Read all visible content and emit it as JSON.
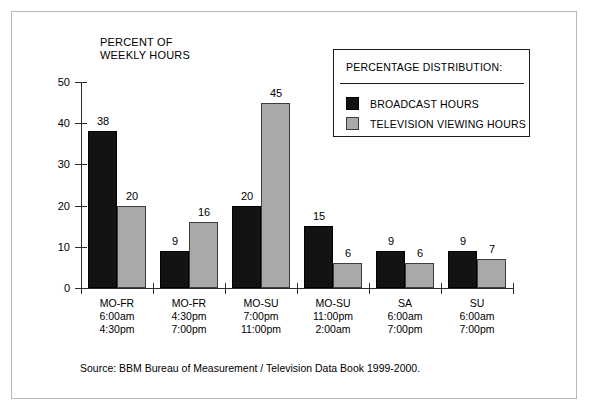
{
  "chart_data": {
    "type": "bar",
    "title": "PERCENT OF\nWEEKLY HOURS",
    "xlabel": "",
    "ylabel": "PERCENT OF WEEKLY HOURS",
    "ylim": [
      0,
      50
    ],
    "yticks": [
      0,
      10,
      20,
      30,
      40,
      50
    ],
    "grid": false,
    "legend_position": "top-right",
    "legend_title": "PERCENTAGE DISTRIBUTION:",
    "categories": [
      "MO-FR\n6:00am\n4:30pm",
      "MO-FR\n4:30pm\n7:00pm",
      "MO-SU\n7:00pm\n11:00pm",
      "MO-SU\n11:00pm\n2:00am",
      "SA\n6:00am\n7:00pm",
      "SU\n6:00am\n7:00pm"
    ],
    "series": [
      {
        "name": "BROADCAST HOURS",
        "color": "#131313",
        "values": [
          38,
          9,
          20,
          15,
          9,
          9
        ]
      },
      {
        "name": "TELEVISION VIEWING HOURS",
        "color": "#a9a9a9",
        "values": [
          20,
          16,
          45,
          6,
          6,
          7
        ]
      }
    ],
    "source": "Source: BBM Bureau of Measurement / Television Data Book 1999-2000."
  },
  "colors": {
    "broadcast": "#131313",
    "viewing": "#a9a9a9",
    "axis": "#2b2b2b",
    "frame": "#b9b9b9"
  }
}
